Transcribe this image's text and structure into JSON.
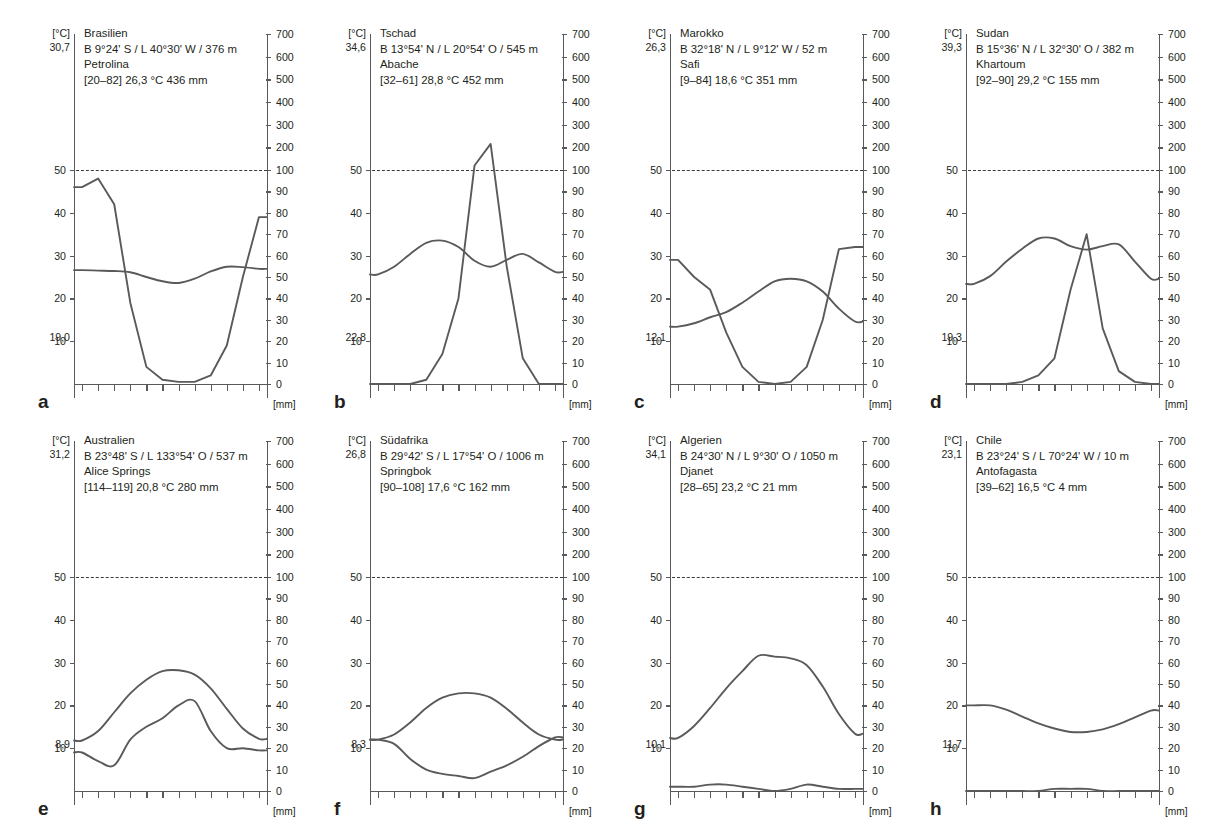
{
  "figure": {
    "type": "walter-lieth-climate-diagrams",
    "panel_count": 8,
    "left_axis_unit": "[°C]",
    "right_axis_unit": "[mm]",
    "temp_ticks": [
      10,
      20,
      30,
      40,
      50
    ],
    "precip_ticks_lower": [
      0,
      10,
      20,
      30,
      40,
      50,
      60,
      70,
      80,
      90,
      100
    ],
    "precip_ticks_upper": [
      200,
      300,
      400,
      500,
      600,
      700
    ],
    "arid_reference_line": {
      "temp": 50,
      "precip": 100
    },
    "months": 12,
    "curve_color": "#5a5a5a",
    "axis_color": "#58595b"
  },
  "chart_data": [
    {
      "type": "line",
      "letter": "a",
      "country": "Brasilien",
      "coords": "B 9°24' S / L 40°30' W / 376 m",
      "station": "Petrolina",
      "summary": "[20–82]  26,3 °C  436 mm",
      "period": "[20–82]",
      "mean_temp": "26,3 °C",
      "annual_precip": "436 mm",
      "temp_max_abs": "30,7",
      "temp_min_abs": "19,0",
      "xlabel": "",
      "ylabel": "[°C]",
      "y2label": "[mm]",
      "temperature": [
        26.6,
        26.5,
        26.4,
        26.1,
        25.0,
        24.0,
        23.6,
        24.6,
        26.3,
        27.4,
        27.3,
        26.9
      ],
      "precipitation": [
        92,
        96,
        84,
        38,
        8,
        2,
        1,
        1,
        4,
        18,
        50,
        78
      ]
    },
    {
      "type": "line",
      "letter": "b",
      "country": "Tschad",
      "coords": "B 13°54' N / L 20°54' O / 545 m",
      "station": "Abache",
      "summary": "[32–61]  28,8 °C  452 mm",
      "period": "[32–61]",
      "mean_temp": "28,8 °C",
      "annual_precip": "452 mm",
      "temp_max_abs": "34,6",
      "temp_min_abs": "22,8",
      "xlabel": "",
      "ylabel": "[°C]",
      "y2label": "[mm]",
      "temperature": [
        25.6,
        27.4,
        30.4,
        33.0,
        33.5,
        32.0,
        28.8,
        27.4,
        29.0,
        30.4,
        28.4,
        26.2
      ],
      "precipitation": [
        0,
        0,
        0,
        2,
        14,
        40,
        120,
        215,
        55,
        12,
        0,
        0
      ]
    },
    {
      "type": "line",
      "letter": "c",
      "country": "Marokko",
      "coords": "B 32°18' N / L 9°12' W / 52 m",
      "station": "Safi",
      "summary": "[9–84]  18,6 °C  351 mm",
      "period": "[9–84]",
      "mean_temp": "18,6 °C",
      "annual_precip": "351 mm",
      "temp_max_abs": "26,3",
      "temp_min_abs": "12,1",
      "xlabel": "",
      "ylabel": "[°C]",
      "y2label": "[mm]",
      "temperature": [
        13.4,
        14.2,
        15.6,
        16.8,
        19.0,
        21.6,
        24.0,
        24.6,
        24.0,
        21.6,
        17.6,
        14.6
      ],
      "precipitation": [
        58,
        50,
        44,
        24,
        8,
        1,
        0,
        1,
        8,
        30,
        63,
        64
      ]
    },
    {
      "type": "line",
      "letter": "d",
      "country": "Sudan",
      "coords": "B 15°36' N / L 32°30' O / 382 m",
      "station": "Khartoum",
      "summary": "[92–90]  29,2 °C  155 mm",
      "period": "[92–90]",
      "mean_temp": "29,2 °C",
      "annual_precip": "155 mm",
      "temp_max_abs": "39,3",
      "temp_min_abs": "19,3",
      "xlabel": "",
      "ylabel": "[°C]",
      "y2label": "[mm]",
      "temperature": [
        23.4,
        25.2,
        28.6,
        31.6,
        34.0,
        34.0,
        32.2,
        31.4,
        32.2,
        32.6,
        28.6,
        24.6
      ],
      "precipitation": [
        0,
        0,
        0,
        1,
        4,
        12,
        44,
        70,
        26,
        6,
        1,
        0
      ]
    },
    {
      "type": "line",
      "letter": "e",
      "country": "Australien",
      "coords": "B 23°48' S / L 133°54' O / 537 m",
      "station": "Alice Springs",
      "summary": "[114–119]  20,8 °C  280 mm",
      "period": "[114–119]",
      "mean_temp": "20,8 °C",
      "annual_precip": "280 mm",
      "temp_max_abs": "31,2",
      "temp_min_abs": "8,9",
      "xlabel": "",
      "ylabel": "[°C]",
      "y2label": "[mm]",
      "temperature": [
        11.8,
        14.0,
        18.4,
        22.8,
        26.0,
        28.0,
        28.2,
        27.2,
        24.0,
        19.2,
        14.6,
        12.2
      ],
      "precipitation": [
        18,
        14,
        12,
        24,
        30,
        34,
        40,
        42,
        28,
        20,
        20,
        19
      ]
    },
    {
      "type": "line",
      "letter": "f",
      "country": "Südafrika",
      "coords": "B 29°42' S / L 17°54' O / 1006 m",
      "station": "Springbok",
      "summary": "[90–108]  17,6 °C  162 mm",
      "period": "[90–108]",
      "mean_temp": "17,6 °C",
      "annual_precip": "162 mm",
      "temp_max_abs": "26,8",
      "temp_min_abs": "8,3",
      "xlabel": "",
      "ylabel": "[°C]",
      "y2label": "[mm]",
      "temperature": [
        12.0,
        13.2,
        16.0,
        19.4,
        21.8,
        22.8,
        22.8,
        21.8,
        19.2,
        16.0,
        13.2,
        12.0
      ],
      "precipitation": [
        24,
        22,
        15,
        10,
        8,
        7,
        6,
        9,
        12,
        16,
        21,
        25
      ]
    },
    {
      "type": "line",
      "letter": "g",
      "country": "Algerien",
      "coords": "B 24°30' N / L 9°30' O / 1050 m",
      "station": "Djanet",
      "summary": "[28–65]  23,2 °C  21 mm",
      "period": "[28–65]",
      "mean_temp": "23,2 °C",
      "annual_precip": "21 mm",
      "temp_max_abs": "34,1",
      "temp_min_abs": "10,1",
      "xlabel": "",
      "ylabel": "[°C]",
      "y2label": "[mm]",
      "temperature": [
        12.4,
        15.2,
        19.4,
        24.0,
        28.0,
        31.6,
        31.4,
        31.0,
        29.4,
        24.4,
        18.0,
        13.4
      ],
      "precipitation": [
        2,
        2,
        3,
        3,
        2,
        1,
        0,
        1,
        3,
        2,
        1,
        1
      ]
    },
    {
      "type": "line",
      "letter": "h",
      "country": "Chile",
      "coords": "B 23°24' S / L 70°24' W / 10 m",
      "station": "Antofagasta",
      "summary": "[39–62]  16,5 °C  4 mm",
      "period": "[39–62]",
      "mean_temp": "16,5 °C",
      "annual_precip": "4 mm",
      "temp_max_abs": "23,1",
      "temp_min_abs": "11,7",
      "xlabel": "",
      "ylabel": "[°C]",
      "y2label": "[mm]",
      "temperature": [
        20.0,
        20.0,
        19.0,
        17.4,
        15.8,
        14.6,
        13.8,
        13.8,
        14.4,
        15.6,
        17.2,
        18.8
      ],
      "precipitation": [
        0,
        0,
        0,
        0,
        0,
        1,
        1,
        1,
        0,
        0,
        0,
        0
      ]
    }
  ]
}
